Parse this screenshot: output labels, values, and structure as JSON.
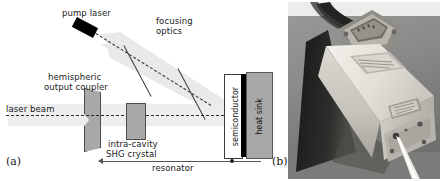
{
  "figure": {
    "panel_a_letter": "(a)",
    "panel_b_letter": "(b)",
    "panel_a_type": "schematic diagram",
    "panel_b_type": "photograph"
  },
  "schematic": {
    "labels": {
      "pump_laser": "pump laser",
      "focusing_optics_line1": "focusing",
      "focusing_optics_line2": "optics",
      "output_coupler_line1": "hemispheric",
      "output_coupler_line2": "output coupler",
      "laser_beam": "laser beam",
      "shg_crystal_line1": "intra-cavity",
      "shg_crystal_line2": "SHG crystal",
      "semiconductor": "semiconductor",
      "heat_sink": "heat sink",
      "resonator": "resonator"
    },
    "colors": {
      "pump_laser_body": "#000000",
      "optic_gray": "#a8a8a8",
      "beam_cone": "#e2e2e2",
      "semiconductor_fill": "#ffffff",
      "semiconductor_coating": "#000000",
      "heat_sink_fill": "#a8a8a8",
      "dashed_beam": "#2b2b2b",
      "text": "#1a1a1a",
      "background": "#ffffff"
    }
  },
  "photograph": {
    "description": "laser module device with cable connector and emitted beam",
    "colors": {
      "background": "#8d8d8d",
      "device_top": "#e8e6e0",
      "device_side": "#cfccc4",
      "device_shadow": "#1c1c1c",
      "cable": "#2a2a2a",
      "beam": "#f2f2ee"
    }
  }
}
